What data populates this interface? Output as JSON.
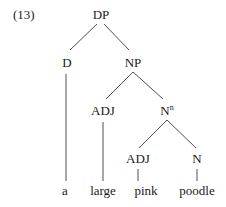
{
  "example_number": "(13)",
  "tree": {
    "root": "DP",
    "nodes": {
      "dp": {
        "label": "DP"
      },
      "d": {
        "label": "D"
      },
      "np": {
        "label": "NP"
      },
      "adj1": {
        "label": "ADJ"
      },
      "nbar": {
        "label": "N",
        "superscript": "n"
      },
      "adj2": {
        "label": "ADJ"
      },
      "n": {
        "label": "N"
      }
    },
    "leaves": {
      "a": "a",
      "large": "large",
      "pink": "pink",
      "poodle": "poodle"
    },
    "structure": "[DP [D a] [NP [ADJ large] [N^n [ADJ pink] [N poodle]]]]"
  }
}
